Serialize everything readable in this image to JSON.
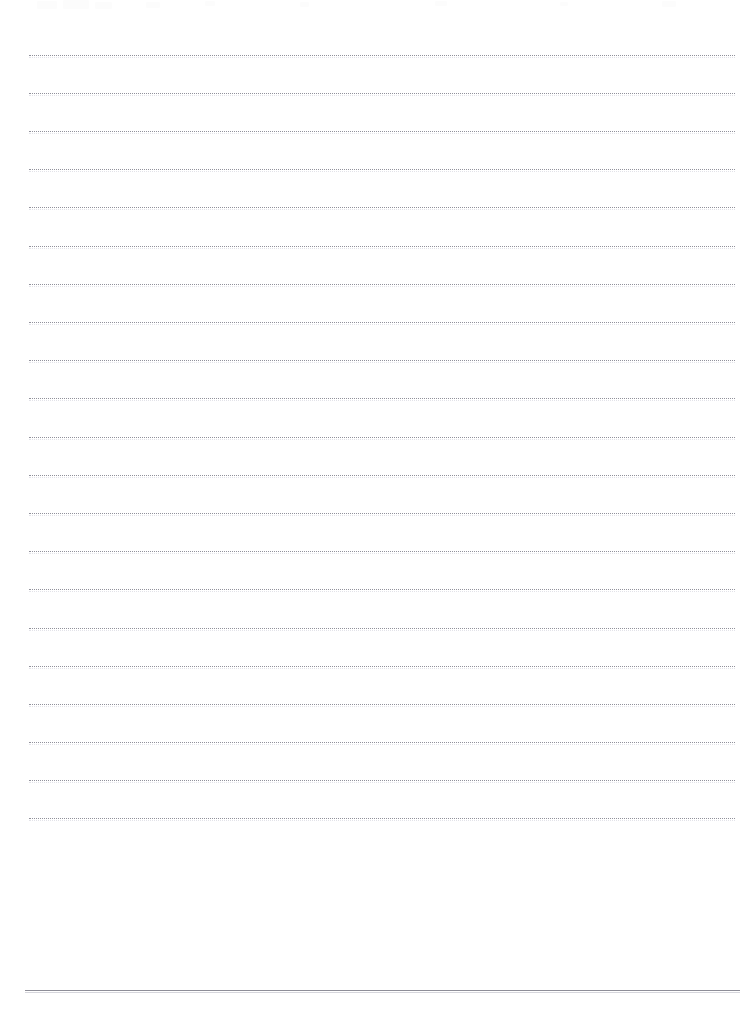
{
  "page": {
    "width_px": 754,
    "height_px": 1025,
    "background_color": "#ffffff",
    "visible_text": ""
  },
  "rules": {
    "dotted": {
      "color": "#8c8c96",
      "style": "dotted",
      "thickness_px": 1,
      "left_px": 29,
      "right_px": 735,
      "count": 21,
      "first_y_px": 55,
      "spacing_px": 38.1,
      "y_positions": [
        55,
        93,
        131,
        169,
        207,
        246,
        284,
        322,
        360,
        398,
        437,
        475,
        513,
        551,
        589,
        628,
        666,
        704,
        742,
        780,
        818
      ]
    },
    "solid": {
      "color": "#8e8e98",
      "style": "solid",
      "thickness_px": 1,
      "left_px": 25,
      "right_px": 740,
      "y_px": 990,
      "count": 1
    }
  },
  "artifacts": {
    "description": "faint residual scan marks along the top edge",
    "color": "#fbfbfc",
    "marks": [
      {
        "x": 37,
        "y": 1,
        "w": 20,
        "h": 8
      },
      {
        "x": 63,
        "y": 0,
        "w": 26,
        "h": 9
      },
      {
        "x": 95,
        "y": 2,
        "w": 17,
        "h": 7
      },
      {
        "x": 146,
        "y": 2,
        "w": 14,
        "h": 6
      },
      {
        "x": 205,
        "y": 1,
        "w": 10,
        "h": 5
      },
      {
        "x": 300,
        "y": 2,
        "w": 9,
        "h": 5
      },
      {
        "x": 435,
        "y": 1,
        "w": 12,
        "h": 5
      },
      {
        "x": 560,
        "y": 2,
        "w": 8,
        "h": 4
      },
      {
        "x": 662,
        "y": 1,
        "w": 14,
        "h": 6
      }
    ]
  }
}
